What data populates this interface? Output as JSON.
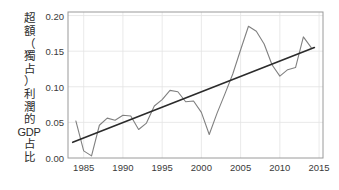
{
  "chart_data": {
    "type": "line",
    "title": "",
    "subtitle": "",
    "xlabel": "",
    "ylabel": "超額（獨占）利潤的GDP占比",
    "ylabel_chars": [
      "超",
      "額",
      "（",
      "獨",
      "占",
      "）",
      "利",
      "潤",
      "的",
      "GDP",
      "占",
      "比"
    ],
    "xlim": [
      1983,
      2015.5
    ],
    "ylim": [
      0.0,
      0.205
    ],
    "grid": true,
    "legend": false,
    "legend_position": "none",
    "xticks": [
      "1985",
      "1990",
      "1995",
      "2000",
      "2005",
      "2010",
      "2015"
    ],
    "xtick_values": [
      1985,
      1990,
      1995,
      2000,
      2005,
      2010,
      2015
    ],
    "yticks": [
      "0.00",
      "0.05",
      "0.10",
      "0.15",
      "0.20"
    ],
    "ytick_values": [
      0.0,
      0.05,
      0.1,
      0.15,
      0.2
    ],
    "x": [
      1984,
      1985,
      1986,
      1987,
      1988,
      1989,
      1990,
      1991,
      1992,
      1993,
      1994,
      1995,
      1996,
      1997,
      1998,
      1999,
      2000,
      2001,
      2002,
      2003,
      2004,
      2005,
      2006,
      2007,
      2008,
      2009,
      2010,
      2011,
      2012,
      2013,
      2014
    ],
    "series": [
      {
        "name": "超額（獨占）利潤的GDP占比",
        "color": "#808080",
        "width": 1.1,
        "values": [
          0.052,
          0.01,
          0.003,
          0.046,
          0.056,
          0.053,
          0.06,
          0.059,
          0.04,
          0.049,
          0.073,
          0.082,
          0.095,
          0.093,
          0.079,
          0.08,
          0.064,
          0.033,
          0.063,
          0.09,
          0.118,
          0.152,
          0.185,
          0.178,
          0.16,
          0.131,
          0.115,
          0.124,
          0.127,
          0.17,
          0.155
        ]
      },
      {
        "name": "線性趨勢線",
        "color": "#2b2b2b",
        "width": 1.6,
        "type": "trend",
        "x_endpoints": [
          1983.6,
          2014.4
        ],
        "y_endpoints": [
          0.022,
          0.155
        ]
      }
    ],
    "axis_color": "#9a9a9a",
    "grid_color": "#e3e3e3",
    "background": "#ffffff"
  }
}
